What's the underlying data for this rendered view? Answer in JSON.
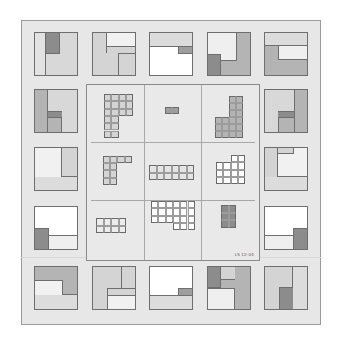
{
  "colors": {
    "white": "#ffffff",
    "light": "#ececec",
    "mid": "#d4d4d4",
    "midDark": "#b4b4b4",
    "dark": "#8c8c8c",
    "frame_bg": "#e7e7e7",
    "stroke": "#6e6e6e"
  },
  "outer_tiles": [
    {
      "id": "t1",
      "x": 34,
      "y": 32,
      "bg": "#d8d8d8",
      "rects": [
        {
          "x": 0,
          "y": 0,
          "w": 12,
          "h": 44,
          "c": "#e2e2e2",
          "b": "r"
        },
        {
          "x": 12,
          "y": 0,
          "w": 14,
          "h": 22,
          "c": "#8c8c8c",
          "b": "rb"
        }
      ]
    },
    {
      "id": "t2",
      "x": 92,
      "y": 32,
      "bg": "#d4d4d4",
      "rects": [
        {
          "x": 14,
          "y": 0,
          "w": 30,
          "h": 15,
          "c": "#f1f1f1",
          "b": "lb"
        },
        {
          "x": 14,
          "y": 15,
          "w": 12,
          "h": 6,
          "c": "#d4d4d4",
          "b": "l"
        },
        {
          "x": 26,
          "y": 21,
          "w": 18,
          "h": 23,
          "c": "#d4d4d4",
          "b": "lt"
        }
      ]
    },
    {
      "id": "t3",
      "x": 149,
      "y": 32,
      "bg": "#ffffff",
      "rects": [
        {
          "x": 0,
          "y": 0,
          "w": 44,
          "h": 15,
          "c": "#dcdcdc",
          "b": "b"
        },
        {
          "x": 29,
          "y": 15,
          "w": 15,
          "h": 7,
          "c": "#9e9e9e",
          "b": "lb"
        }
      ]
    },
    {
      "id": "t4",
      "x": 207,
      "y": 32,
      "bg": "#b4b4b4",
      "rects": [
        {
          "x": 0,
          "y": 0,
          "w": 30,
          "h": 29,
          "c": "#efefef",
          "b": "rb"
        },
        {
          "x": 0,
          "y": 22,
          "w": 14,
          "h": 22,
          "c": "#8c8c8c",
          "b": "rt"
        }
      ]
    },
    {
      "id": "t5",
      "x": 264,
      "y": 32,
      "bg": "#b4b4b4",
      "rects": [
        {
          "x": 0,
          "y": 0,
          "w": 44,
          "h": 14,
          "c": "#dcdcdc",
          "b": "b"
        },
        {
          "x": 14,
          "y": 14,
          "w": 30,
          "h": 14,
          "c": "#efefef",
          "b": "lb"
        }
      ]
    },
    {
      "id": "t6",
      "x": 34,
      "y": 89,
      "bg": "#d8d8d8",
      "rects": [
        {
          "x": 0,
          "y": 0,
          "w": 14,
          "h": 44,
          "c": "#b4b4b4",
          "b": "r"
        },
        {
          "x": 14,
          "y": 22,
          "w": 14,
          "h": 7,
          "c": "#8c8c8c",
          "b": "tb"
        },
        {
          "x": 14,
          "y": 29,
          "w": 14,
          "h": 15,
          "c": "#b4b4b4",
          "b": "r"
        }
      ]
    },
    {
      "id": "t7",
      "x": 264,
      "y": 89,
      "bg": "#d8d8d8",
      "rects": [
        {
          "x": 30,
          "y": 0,
          "w": 14,
          "h": 44,
          "c": "#b4b4b4",
          "b": "l"
        },
        {
          "x": 14,
          "y": 22,
          "w": 16,
          "h": 7,
          "c": "#8c8c8c",
          "b": "tb"
        },
        {
          "x": 14,
          "y": 29,
          "w": 16,
          "h": 15,
          "c": "#b4b4b4",
          "b": "l"
        }
      ]
    },
    {
      "id": "t8",
      "x": 34,
      "y": 147,
      "bg": "#dcdcdc",
      "rects": [
        {
          "x": 0,
          "y": 0,
          "w": 44,
          "h": 30,
          "c": "#d4d4d4",
          "b": "b"
        },
        {
          "x": 0,
          "y": 0,
          "w": 28,
          "h": 30,
          "c": "#f1f1f1",
          "b": "r"
        },
        {
          "x": 0,
          "y": 0,
          "w": 14,
          "h": 7,
          "c": "#f1f1f1",
          "b": ""
        }
      ]
    },
    {
      "id": "t9",
      "x": 264,
      "y": 147,
      "bg": "#dcdcdc",
      "rects": [
        {
          "x": 0,
          "y": 0,
          "w": 44,
          "h": 30,
          "c": "#f1f1f1",
          "b": "b"
        },
        {
          "x": 0,
          "y": 0,
          "w": 14,
          "h": 30,
          "c": "#d4d4d4",
          "b": "r"
        },
        {
          "x": 14,
          "y": 0,
          "w": 16,
          "h": 7,
          "c": "#d4d4d4",
          "b": "rb"
        }
      ]
    },
    {
      "id": "t10",
      "x": 34,
      "y": 206,
      "bg": "#ffffff",
      "rects": [
        {
          "x": 14,
          "y": 29,
          "w": 30,
          "h": 15,
          "c": "#efefef",
          "b": "t"
        },
        {
          "x": 0,
          "y": 22,
          "w": 15,
          "h": 22,
          "c": "#8c8c8c",
          "b": "rt"
        }
      ]
    },
    {
      "id": "t11",
      "x": 264,
      "y": 206,
      "bg": "#ffffff",
      "rects": [
        {
          "x": 0,
          "y": 29,
          "w": 30,
          "h": 15,
          "c": "#efefef",
          "b": "t"
        },
        {
          "x": 29,
          "y": 22,
          "w": 15,
          "h": 22,
          "c": "#8c8c8c",
          "b": "lt"
        }
      ]
    },
    {
      "id": "t12",
      "x": 34,
      "y": 266,
      "bg": "#dcdcdc",
      "rects": [
        {
          "x": 0,
          "y": 0,
          "w": 44,
          "h": 29,
          "c": "#b4b4b4",
          "b": "b"
        },
        {
          "x": 0,
          "y": 14,
          "w": 29,
          "h": 15,
          "c": "#f1f1f1",
          "b": "tr"
        }
      ]
    },
    {
      "id": "t13",
      "x": 92,
      "y": 266,
      "bg": "#d4d4d4",
      "rects": [
        {
          "x": 15,
          "y": 29,
          "w": 29,
          "h": 15,
          "c": "#f1f1f1",
          "b": "lt"
        },
        {
          "x": 29,
          "y": 0,
          "w": 15,
          "h": 22,
          "c": "#d4d4d4",
          "b": "l"
        },
        {
          "x": 15,
          "y": 22,
          "w": 29,
          "h": 7,
          "c": "#d4d4d4",
          "b": "lt"
        }
      ]
    },
    {
      "id": "t14",
      "x": 149,
      "y": 266,
      "bg": "#ffffff",
      "rects": [
        {
          "x": 0,
          "y": 29,
          "w": 44,
          "h": 15,
          "c": "#dcdcdc",
          "b": "t"
        },
        {
          "x": 29,
          "y": 22,
          "w": 15,
          "h": 7,
          "c": "#9e9e9e",
          "b": "lt"
        }
      ]
    },
    {
      "id": "t15",
      "x": 207,
      "y": 266,
      "bg": "#b4b4b4",
      "rects": [
        {
          "x": 0,
          "y": 22,
          "w": 28,
          "h": 22,
          "c": "#efefef",
          "b": "rt"
        },
        {
          "x": 0,
          "y": 0,
          "w": 14,
          "h": 22,
          "c": "#8c8c8c",
          "b": "rb"
        },
        {
          "x": 14,
          "y": 0,
          "w": 14,
          "h": 14,
          "c": "#d4d4d4",
          "b": "b"
        }
      ]
    },
    {
      "id": "t16",
      "x": 264,
      "y": 266,
      "bg": "#dcdcdc",
      "rects": [
        {
          "x": 0,
          "y": 0,
          "w": 29,
          "h": 44,
          "c": "#d4d4d4",
          "b": "r"
        },
        {
          "x": 15,
          "y": 21,
          "w": 14,
          "h": 23,
          "c": "#8c8c8c",
          "b": "lt"
        }
      ]
    }
  ],
  "inner_cells": [
    {
      "id": "c1",
      "shape": "L-reversed",
      "x": 17,
      "y": 9,
      "cols": 4,
      "rows": 6,
      "unit": 7.3,
      "fill": "#d4d4d4",
      "cut": {
        "x": 2,
        "y": 3,
        "w": 2,
        "h": 3
      }
    },
    {
      "id": "c2",
      "shape": "bar",
      "x": 78,
      "y": 22,
      "cols": 2,
      "rows": 1,
      "unit": 7,
      "fill": "#9e9e9e"
    },
    {
      "id": "c3",
      "shape": "L",
      "x": 128,
      "y": 11,
      "cols": 4,
      "rows": 6,
      "unit": 7,
      "fill": "#b4b4b4",
      "cut": {
        "x": 0,
        "y": 0,
        "w": 2,
        "h": 3
      }
    },
    {
      "id": "c4",
      "shape": "L-short",
      "x": 16,
      "y": 71,
      "cols": 4,
      "rows": 4,
      "unit": 7.2,
      "fill": "#d4d4d4",
      "cut": {
        "x": 2,
        "y": 1,
        "w": 2,
        "h": 3
      }
    },
    {
      "id": "c5",
      "shape": "rect",
      "x": 62,
      "y": 80,
      "cols": 6,
      "rows": 2,
      "unit": 7.5,
      "fill": "#e4e4e4"
    },
    {
      "id": "c6",
      "shape": "notched",
      "x": 129,
      "y": 70,
      "cols": 4,
      "rows": 4,
      "unit": 7.3,
      "fill": "#ffffff",
      "cut": {
        "x": 0,
        "y": 0,
        "w": 2,
        "h": 1
      }
    },
    {
      "id": "c7",
      "shape": "rect",
      "x": 9,
      "y": 133,
      "cols": 4,
      "rows": 2,
      "unit": 7.5,
      "fill": "#ececec"
    },
    {
      "id": "c8",
      "shape": "notched",
      "x": 64,
      "y": 116,
      "cols": 6,
      "rows": 4,
      "unit": 7.3,
      "fill": "#ffffff",
      "cut": {
        "x": 0,
        "y": 3,
        "w": 3,
        "h": 1
      }
    },
    {
      "id": "c9",
      "shape": "rect",
      "x": 134,
      "y": 120,
      "cols": 2,
      "rows": 3,
      "unit": 7.5,
      "fill": "#8c8c8c"
    }
  ],
  "inner_label": "LS 12-04"
}
